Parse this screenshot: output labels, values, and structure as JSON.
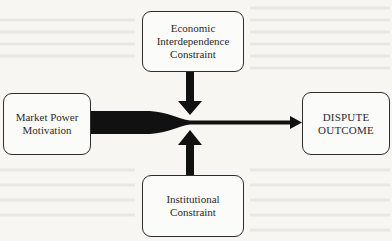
{
  "diagram": {
    "nodes": {
      "market_power": {
        "lines": [
          "Market Power",
          "Motivation"
        ]
      },
      "economic": {
        "lines": [
          "Economic",
          "Interdependence",
          "Constraint"
        ]
      },
      "institutional": {
        "lines": [
          "Institutional",
          "Constraint"
        ]
      },
      "dispute": {
        "lines": [
          "DISPUTE",
          "OUTCOME"
        ]
      }
    },
    "edges": [
      {
        "from": "market_power",
        "to": "dispute",
        "style": "thick-tapering-arrow"
      },
      {
        "from": "economic",
        "to": "main-arrow",
        "style": "thick-down-arrow"
      },
      {
        "from": "institutional",
        "to": "main-arrow",
        "style": "thick-up-arrow"
      }
    ],
    "colors": {
      "arrow": "#111111",
      "box_border": "#2d2d2d",
      "background": "#f7f6f3"
    }
  }
}
